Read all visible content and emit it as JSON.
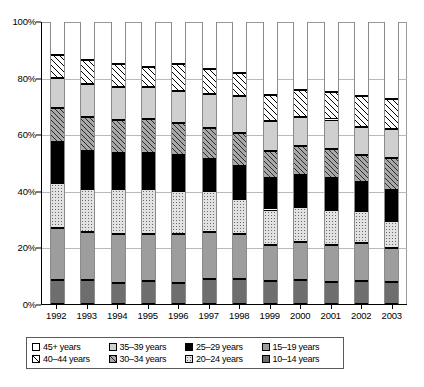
{
  "chart_data": {
    "type": "bar",
    "title": "",
    "subtitle": "",
    "xlabel": "",
    "ylabel": "",
    "stacked": true,
    "percent_stacked": true,
    "grid": true,
    "legend_position": "bottom",
    "ylim": [
      0,
      100
    ],
    "y_ticks": [
      "0%",
      "20%",
      "40%",
      "60%",
      "80%",
      "100%"
    ],
    "y_tick_values": [
      0,
      20,
      40,
      60,
      80,
      100
    ],
    "categories": [
      "1992",
      "1993",
      "1994",
      "1995",
      "1996",
      "1997",
      "1998",
      "1999",
      "2000",
      "2001",
      "2002",
      "2003"
    ],
    "series": [
      {
        "name": "10–14 years",
        "swatch": "dark-gray",
        "fill": "f-dgray",
        "values": [
          8.5,
          8.5,
          7.5,
          8.0,
          7.3,
          8.7,
          8.8,
          8.0,
          8.6,
          7.7,
          8.2,
          7.8
        ]
      },
      {
        "name": "15–19 years",
        "swatch": "medium-gray",
        "fill": "f-mgray",
        "values": [
          18.5,
          16.8,
          17.1,
          16.9,
          17.6,
          16.6,
          15.8,
          13.0,
          13.2,
          13.2,
          13.4,
          12.0
        ]
      },
      {
        "name": "20–24 years",
        "swatch": "light-dotted",
        "fill": "f-dots",
        "values": [
          15.9,
          15.5,
          16.0,
          15.9,
          15.1,
          14.5,
          12.5,
          12.4,
          12.4,
          12.3,
          11.2,
          9.5
        ]
      },
      {
        "name": "25–29 years",
        "swatch": "solid-black",
        "fill": "f-black",
        "values": [
          14.3,
          13.4,
          12.6,
          12.6,
          12.5,
          11.5,
          11.6,
          11.0,
          11.3,
          11.4,
          10.3,
          11.0
        ]
      },
      {
        "name": "30–34 years",
        "swatch": "gray-hatched",
        "fill": "f-hatch-g",
        "values": [
          12.0,
          12.0,
          11.7,
          12.1,
          11.3,
          10.9,
          11.6,
          9.8,
          10.3,
          10.1,
          9.4,
          11.2
        ]
      },
      {
        "name": "35–39 years",
        "swatch": "light-gray",
        "fill": "f-ltgray",
        "values": [
          10.8,
          11.5,
          11.8,
          11.1,
          11.4,
          12.1,
          13.3,
          10.5,
          10.4,
          10.5,
          9.9,
          10.5
        ]
      },
      {
        "name": "40–44 years",
        "swatch": "white-hatched",
        "fill": "f-hatch-w",
        "values": [
          7.9,
          8.7,
          8.1,
          7.3,
          9.6,
          8.8,
          8.1,
          9.0,
          9.5,
          9.6,
          11.1,
          10.3
        ]
      },
      {
        "name": "45+ years",
        "swatch": "white",
        "fill": "f-white",
        "values": [
          12.1,
          13.6,
          15.2,
          16.1,
          15.2,
          16.9,
          18.3,
          26.3,
          24.3,
          25.2,
          26.5,
          27.7
        ]
      }
    ],
    "legend_entries": [
      {
        "label": "45+ years",
        "swatch": "white"
      },
      {
        "label": "35–39 years",
        "swatch": "light-gray"
      },
      {
        "label": "25–29 years",
        "swatch": "solid-black"
      },
      {
        "label": "15–19 years",
        "swatch": "medium-gray"
      },
      {
        "label": "40–44 years",
        "swatch": "white-hatched"
      },
      {
        "label": "30–34 years",
        "swatch": "gray-hatched"
      },
      {
        "label": "20–24 years",
        "swatch": "light-dotted"
      },
      {
        "label": "10–14 years",
        "swatch": "dark-gray"
      }
    ],
    "colors": {
      "white": "#ffffff",
      "white-hatched": "#ffffff",
      "light-gray": "#cfcfcf",
      "gray-hatched": "#a8a8a8",
      "solid-black": "#000000",
      "light-dotted": "#e2e2e2",
      "medium-gray": "#9d9d9d",
      "dark-gray": "#6e6e6e",
      "gridline": "#b9b9b9",
      "axis": "#000000"
    }
  }
}
